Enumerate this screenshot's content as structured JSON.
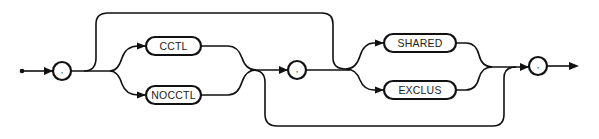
{
  "diagram": {
    "type": "syntax-railroad",
    "separators": {
      "first": ",",
      "middle": ",",
      "last": ","
    },
    "group1": {
      "options": [
        "CCTL",
        "NOCCTL"
      ],
      "optional": true
    },
    "group2": {
      "options": [
        "SHARED",
        "EXCLUS"
      ],
      "optional": true
    },
    "colors": {
      "stroke": "#111111",
      "background": "#ffffff"
    }
  }
}
